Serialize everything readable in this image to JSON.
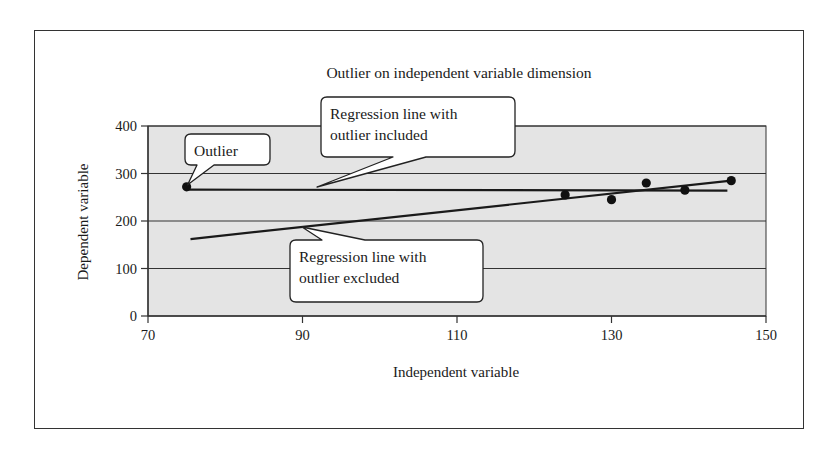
{
  "chart_data": {
    "type": "scatter",
    "title": "Outlier on independent variable dimension",
    "xlabel": "Independent variable",
    "ylabel": "Dependent variable",
    "xlim": [
      70,
      150
    ],
    "ylim": [
      0,
      400
    ],
    "x_ticks": [
      70,
      90,
      110,
      130,
      150
    ],
    "y_ticks": [
      0,
      100,
      200,
      300,
      400
    ],
    "grid": "horizontal",
    "legend": null,
    "series": [
      {
        "name": "Data points",
        "points": [
          {
            "x": 75,
            "y": 272
          },
          {
            "x": 124,
            "y": 255
          },
          {
            "x": 130,
            "y": 245
          },
          {
            "x": 134.5,
            "y": 280
          },
          {
            "x": 139.5,
            "y": 265
          },
          {
            "x": 145.5,
            "y": 285
          }
        ]
      }
    ],
    "lines": [
      {
        "name": "Regression line with outlier included",
        "x": [
          75,
          145
        ],
        "y": [
          266,
          264
        ]
      },
      {
        "name": "Regression line with outlier excluded",
        "x": [
          75.5,
          145.5
        ],
        "y": [
          162,
          285
        ]
      }
    ],
    "annotations": [
      {
        "label": "Outlier",
        "points_to": "outlier point (75, 272)"
      },
      {
        "label": "Regression line with outlier included",
        "line1": "Regression line with",
        "line2": "outlier included"
      },
      {
        "label": "Regression line with outlier excluded",
        "line1": "Regression line with",
        "line2": "outlier excluded"
      }
    ]
  },
  "colors": {
    "plot_background": "#e4e4e4",
    "lines": "#1a1a1a",
    "callout_fill": "#ffffff"
  }
}
